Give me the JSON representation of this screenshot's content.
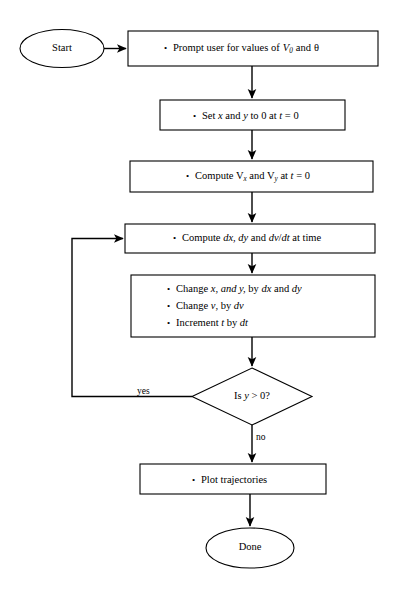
{
  "diagram": {
    "type": "flowchart",
    "background": "#ffffff",
    "stroke": "#000000",
    "nodes": {
      "start": {
        "shape": "ellipse",
        "label": "Start"
      },
      "prompt": {
        "shape": "process",
        "bullets": [
          {
            "prefix": "Prompt user for values of",
            "var": "V",
            "subscript": "0",
            "suffix": "and",
            "symbol": "θ"
          }
        ]
      },
      "init_xy": {
        "shape": "process",
        "bullets": [
          {
            "text": "Set x and y to 0 at t = 0"
          }
        ]
      },
      "compute_v": {
        "shape": "process",
        "bullets": [
          {
            "text": "Compute Vx and Vy at t = 0"
          }
        ]
      },
      "compute_d": {
        "shape": "process",
        "bullets": [
          {
            "text": "Compute dx, dy and dv/dt at time"
          }
        ]
      },
      "update": {
        "shape": "process",
        "bullets": [
          {
            "text": "Change x, and y, by dx and dy"
          },
          {
            "text": "Change v, by dv"
          },
          {
            "text": "Increment t by dt"
          }
        ]
      },
      "decision": {
        "shape": "diamond",
        "label": "Is y > 0?"
      },
      "plot": {
        "shape": "process",
        "bullets": [
          {
            "text": "Plot trajectories"
          }
        ]
      },
      "done": {
        "shape": "ellipse",
        "label": "Done"
      }
    },
    "edge_labels": {
      "yes": "yes",
      "no": "no"
    }
  }
}
